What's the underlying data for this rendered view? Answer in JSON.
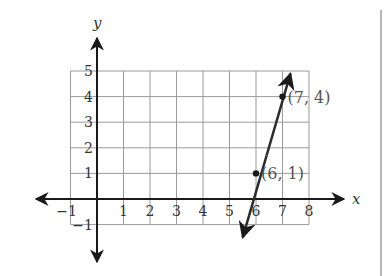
{
  "chart_data": {
    "type": "line",
    "title": "",
    "xlabel": "x",
    "ylabel": "y",
    "xlim": [
      -1,
      8
    ],
    "ylim": [
      -1,
      5
    ],
    "grid": true,
    "x_ticks": [
      "-1",
      "1",
      "2",
      "3",
      "4",
      "5",
      "6",
      "7",
      "8"
    ],
    "y_ticks": [
      "-1",
      "1",
      "2",
      "3",
      "4",
      "5"
    ],
    "series": [
      {
        "name": "line through (6, 1) and (7, 4)",
        "slope": 3,
        "intercept": -17,
        "points": [
          {
            "x": 6,
            "y": 1,
            "label": "(6, 1)"
          },
          {
            "x": 7,
            "y": 4,
            "label": "(7, 4)"
          }
        ],
        "arrow_ends": [
          [
            5.5,
            -1.5
          ],
          [
            7.3,
            4.9
          ]
        ]
      }
    ],
    "colors": {
      "grid": "#9a9a9a",
      "axis": "#1a1a1a",
      "line": "#2a2a2a",
      "label": "#555555",
      "divider": "#b5b5b5"
    }
  }
}
